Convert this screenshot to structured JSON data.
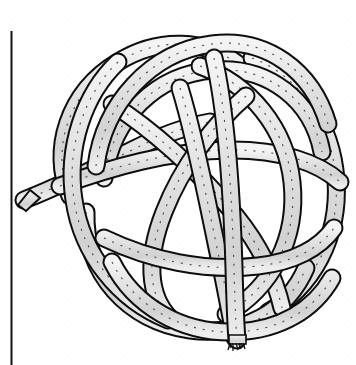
{
  "figure": {
    "kind": "line-illustration",
    "subject": "rope-knot",
    "caption": "",
    "title": ""
  },
  "canvas": {
    "width": 356,
    "height": 365,
    "background_color": "#ffffff"
  },
  "margin_rule": {
    "name": "vertical-margin-line",
    "x": 11,
    "y_start": 31,
    "y_end": 365,
    "thickness": 2,
    "color": "#111111"
  },
  "style": {
    "outline_color": "#0d0d0d",
    "rope_fill_color": "#dcdcdc",
    "rope_highlight_color": "#f2f2f2",
    "twist_line_color": "#2b2b2b",
    "outline_width": 2.0,
    "rope_width": 15
  },
  "knot": {
    "bounds": {
      "x": 16,
      "y": 28,
      "width": 330,
      "height": 318
    },
    "loop_count": 5,
    "free_ends": [
      {
        "name": "left-cut-end",
        "x": 22,
        "y": 198,
        "finish": "flat-cut"
      },
      {
        "name": "bottom-frayed-end",
        "x": 236,
        "y": 342,
        "finish": "frayed"
      }
    ],
    "loops": [
      {
        "name": "loop-upper-left",
        "cx": 140,
        "cy": 140,
        "r": 88,
        "rot": -12
      },
      {
        "name": "loop-upper-right",
        "cx": 232,
        "cy": 130,
        "r": 92,
        "rot": 10
      },
      {
        "name": "loop-right",
        "cx": 248,
        "cy": 196,
        "r": 95,
        "rot": 22
      },
      {
        "name": "loop-lower",
        "cx": 186,
        "cy": 214,
        "r": 92,
        "rot": 5
      },
      {
        "name": "loop-center",
        "cx": 186,
        "cy": 168,
        "r": 72,
        "rot": -30
      }
    ]
  }
}
